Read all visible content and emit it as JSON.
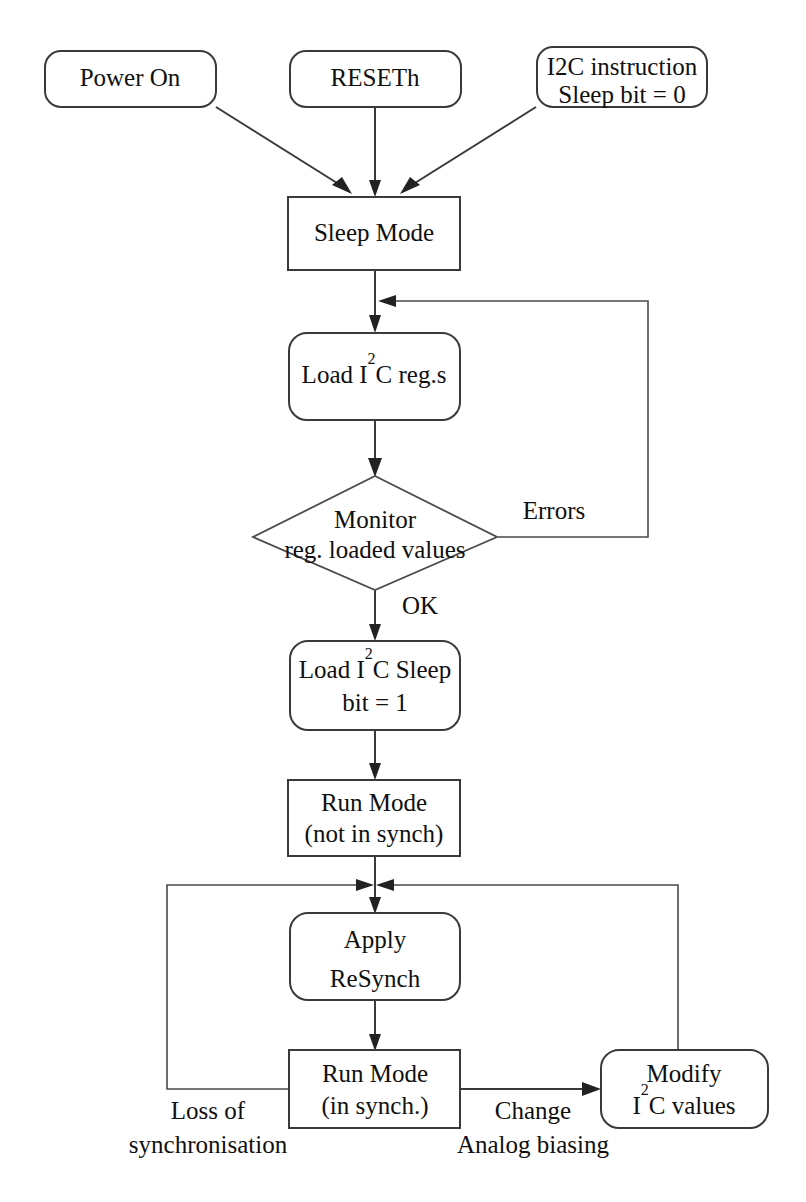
{
  "diagram": {
    "background_color": "#ffffff",
    "line_color": "#3a3a3a",
    "text_color": "#101010"
  },
  "nodes": {
    "power_on": {
      "label": "Power On",
      "shape": "rounded-rect"
    },
    "reseth": {
      "label": "RESETh",
      "shape": "rounded-rect"
    },
    "i2c_instruction_line1": {
      "label": "I2C instruction"
    },
    "i2c_instruction_line2": {
      "label": "Sleep bit = 0"
    },
    "sleep_mode": {
      "label": "Sleep Mode",
      "shape": "rect"
    },
    "load_i2c_regs_pre": {
      "label": "Load I"
    },
    "load_i2c_regs_sup": {
      "label": "2"
    },
    "load_i2c_regs_post": {
      "label": "C reg.s"
    },
    "monitor_line1": {
      "label": "Monitor"
    },
    "monitor_line2": {
      "label": "reg. loaded values"
    },
    "load_sleep_pre": {
      "label": "Load I"
    },
    "load_sleep_sup": {
      "label": "2"
    },
    "load_sleep_post": {
      "label": "C Sleep"
    },
    "load_sleep_line2": {
      "label": "bit = 1"
    },
    "run_mode_not_synch_line1": {
      "label": "Run Mode"
    },
    "run_mode_not_synch_line2": {
      "label": "(not in synch)"
    },
    "apply_resynch_line1": {
      "label": "Apply"
    },
    "apply_resynch_line2": {
      "label": "ReSynch"
    },
    "run_mode_in_synch_line1": {
      "label": "Run Mode"
    },
    "run_mode_in_synch_line2": {
      "label": "(in synch.)"
    },
    "modify_line1": {
      "label": "Modify"
    },
    "modify_pre": {
      "label": "I"
    },
    "modify_sup": {
      "label": "2"
    },
    "modify_post": {
      "label": "C values"
    }
  },
  "edge_labels": {
    "errors": "Errors",
    "ok": "OK",
    "loss_line1": "Loss of",
    "loss_line2": "synchronisation",
    "change_line1": "Change",
    "change_line2": "Analog biasing"
  }
}
